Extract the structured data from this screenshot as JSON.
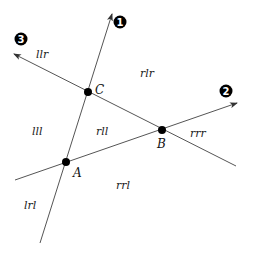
{
  "diagram": {
    "lines": [
      {
        "id": "1",
        "from": [
          40,
          243
        ],
        "to": [
          112,
          14
        ],
        "arrow": true
      },
      {
        "id": "2",
        "from": [
          15,
          180
        ],
        "to": [
          237,
          103
        ],
        "arrow": true
      },
      {
        "id": "3",
        "from": [
          236,
          166
        ],
        "to": [
          14,
          54
        ],
        "arrow": true
      }
    ],
    "markers": [
      {
        "label": "1",
        "x": 120,
        "y": 22
      },
      {
        "label": "2",
        "x": 226,
        "y": 91
      },
      {
        "label": "3",
        "x": 21,
        "y": 39
      }
    ],
    "points": [
      {
        "name": "A",
        "x": 66,
        "y": 162,
        "label_x": 73,
        "label_y": 177
      },
      {
        "name": "B",
        "x": 162,
        "y": 130,
        "label_x": 157,
        "label_y": 148
      },
      {
        "name": "C",
        "x": 88,
        "y": 92,
        "label_x": 95,
        "label_y": 94
      }
    ],
    "regions": [
      {
        "text": "llr",
        "x": 36,
        "y": 58
      },
      {
        "text": "rlr",
        "x": 140,
        "y": 77
      },
      {
        "text": "lll",
        "x": 32,
        "y": 135
      },
      {
        "text": "rll",
        "x": 96,
        "y": 135
      },
      {
        "text": "rrr",
        "x": 190,
        "y": 137
      },
      {
        "text": "rrl",
        "x": 116,
        "y": 189
      },
      {
        "text": "lrl",
        "x": 24,
        "y": 209
      }
    ],
    "line_color": "#555555",
    "point_color": "#000000"
  }
}
